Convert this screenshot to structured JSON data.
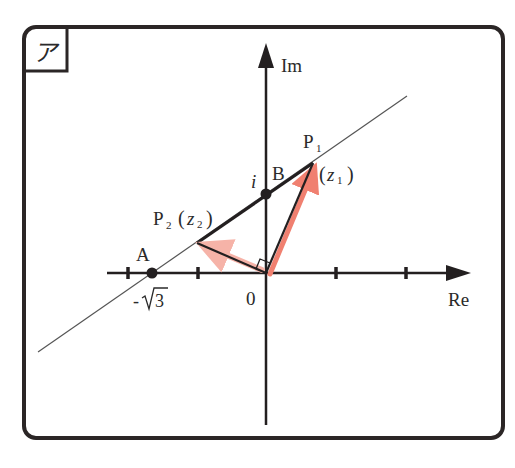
{
  "panel": {
    "label": "ア"
  },
  "axes": {
    "real_label": "Re",
    "imag_label": "Im",
    "origin_label": "0"
  },
  "points": {
    "A": {
      "name": "A",
      "value_label": "-√3",
      "minus": "-",
      "radicand": "3"
    },
    "B": {
      "name": "B",
      "value_label": "i"
    },
    "P1": {
      "name": "P",
      "sub": "1",
      "complex": "z",
      "complex_sub": "1"
    },
    "P2": {
      "name": "P",
      "sub": "2",
      "complex": "z",
      "complex_sub": "2"
    }
  },
  "colors": {
    "ink": "#231f20",
    "frame": "#2b2626",
    "thin_line": "#555555",
    "arrow_highlight": "#f08070",
    "arrow_highlight_light": "#f6b3a8"
  },
  "geometry_notes": {
    "line": "line through A(-√3, 0) and B(0, i)",
    "right_angle": "angle P1-O-P2 = 90°"
  }
}
